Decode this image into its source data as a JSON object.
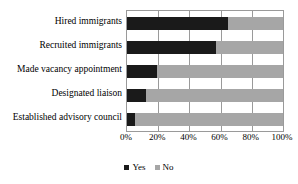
{
  "chart_data": {
    "type": "bar",
    "orientation": "horizontal",
    "stacked": true,
    "stack_total": 100,
    "title": "",
    "subtitle": "",
    "xlabel": "",
    "ylabel": "",
    "xlim": [
      0,
      100
    ],
    "xtick_labels": [
      "0%",
      "20%",
      "40%",
      "60%",
      "80%",
      "100%"
    ],
    "xtick_values": [
      0,
      20,
      40,
      60,
      80,
      100
    ],
    "grid": true,
    "grid_axis": "x",
    "legend_position": "bottom",
    "categories": [
      "Hired immigrants",
      "Recruited immigrants",
      "Made vacancy appointment",
      "Designated liaison",
      "Established advisory council"
    ],
    "series": [
      {
        "name": "Yes",
        "color": "#1a1a1a",
        "values": [
          65,
          57,
          19,
          12,
          5
        ]
      },
      {
        "name": "No",
        "color": "#a6a6a6",
        "values": [
          35,
          43,
          81,
          88,
          95
        ]
      }
    ]
  },
  "legend": {
    "items": [
      {
        "label": "Yes"
      },
      {
        "label": "No"
      }
    ]
  },
  "colors": {
    "yes": "#1a1a1a",
    "no": "#a6a6a6",
    "grid": "#9a9a9a",
    "text": "#000000",
    "background": "#ffffff"
  }
}
